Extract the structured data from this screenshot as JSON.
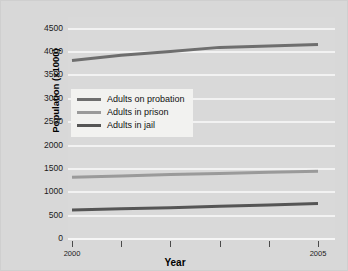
{
  "chart_data": {
    "type": "line",
    "title": "",
    "xlabel": "Year",
    "ylabel": "Population (x1000)",
    "x": [
      2000,
      2001,
      2002,
      2003,
      2004,
      2005
    ],
    "xtick_labels": [
      "2000",
      "",
      "",
      "",
      "",
      "2005"
    ],
    "ytick_labels": [
      "0",
      "500",
      "1000",
      "1500",
      "2000",
      "2500",
      "3000",
      "3500",
      "4000",
      "4500"
    ],
    "yticks": [
      0,
      500,
      1000,
      1500,
      2000,
      2500,
      3000,
      3500,
      4000,
      4500
    ],
    "ylim": [
      0,
      4750
    ],
    "xlim": [
      2000,
      2005
    ],
    "grid": true,
    "legend_position": "upper-left-inset",
    "series": [
      {
        "name": "Adults on probation",
        "color": "#6e6e6e",
        "values": [
          3820,
          3930,
          4010,
          4100,
          4130,
          4160
        ]
      },
      {
        "name": "Adults in prison",
        "color": "#9a9a9a",
        "values": [
          1320,
          1350,
          1380,
          1400,
          1430,
          1450
        ]
      },
      {
        "name": "Adults in jail",
        "color": "#555555",
        "values": [
          620,
          645,
          670,
          700,
          730,
          760
        ]
      }
    ]
  },
  "axes": {
    "ylabel": "Population (x1000)",
    "xlabel": "Year"
  },
  "legend": {
    "items": [
      {
        "label": "Adults on probation"
      },
      {
        "label": "Adults in prison"
      },
      {
        "label": "Adults in jail"
      }
    ]
  },
  "colors": {
    "plot_background": "#d9d9d9",
    "figure_background": "#d8d8d8",
    "gridline": "#f2f2f2",
    "legend_background": "#f2f2f0",
    "text": "#1a1a1a"
  }
}
